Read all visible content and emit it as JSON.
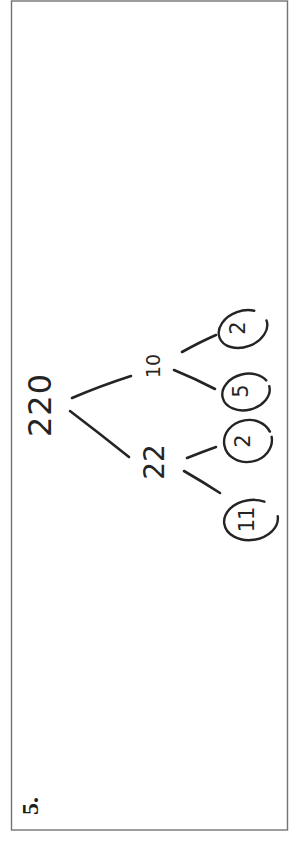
{
  "page": {
    "problem_number": "5."
  },
  "tree": {
    "root": "220",
    "branches": [
      {
        "value": "22",
        "children": [
          "11",
          "2"
        ]
      },
      {
        "value": "10",
        "children": [
          "5",
          "2"
        ]
      }
    ],
    "leaves": [
      {
        "value": "11",
        "circled": true
      },
      {
        "value": "2",
        "circled": true
      },
      {
        "value": "5",
        "circled": true
      },
      {
        "value": "2",
        "circled": true
      }
    ],
    "edges": [
      "220-22",
      "220-10",
      "22-11",
      "22-2",
      "10-5",
      "10-2"
    ]
  },
  "colors": {
    "ink": "#242424",
    "border": "#5a5a5a",
    "background": "#ffffff"
  }
}
